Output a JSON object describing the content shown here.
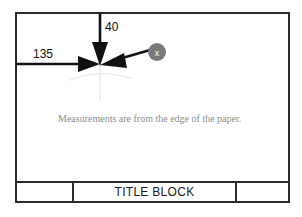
{
  "sheet": {
    "background_color": "#ffffff",
    "border_color": "#2b2b2b"
  },
  "dimensions": [
    {
      "id": "horizontal",
      "value": "135",
      "direction": "right",
      "origin": "left-edge"
    },
    {
      "id": "vertical",
      "value": "40",
      "direction": "down",
      "origin": "top-edge"
    }
  ],
  "marker": {
    "label": "x",
    "fill_color": "#7a7a7a",
    "text_color": "#ffffff"
  },
  "note": {
    "text": "Measurements are from the edge of the paper.",
    "color": "#8d8d8d"
  },
  "title_block": {
    "left_cell": "",
    "center_cell": "TITLE BLOCK",
    "right_cell": ""
  },
  "guides": {
    "color": "#e2e2e2"
  }
}
